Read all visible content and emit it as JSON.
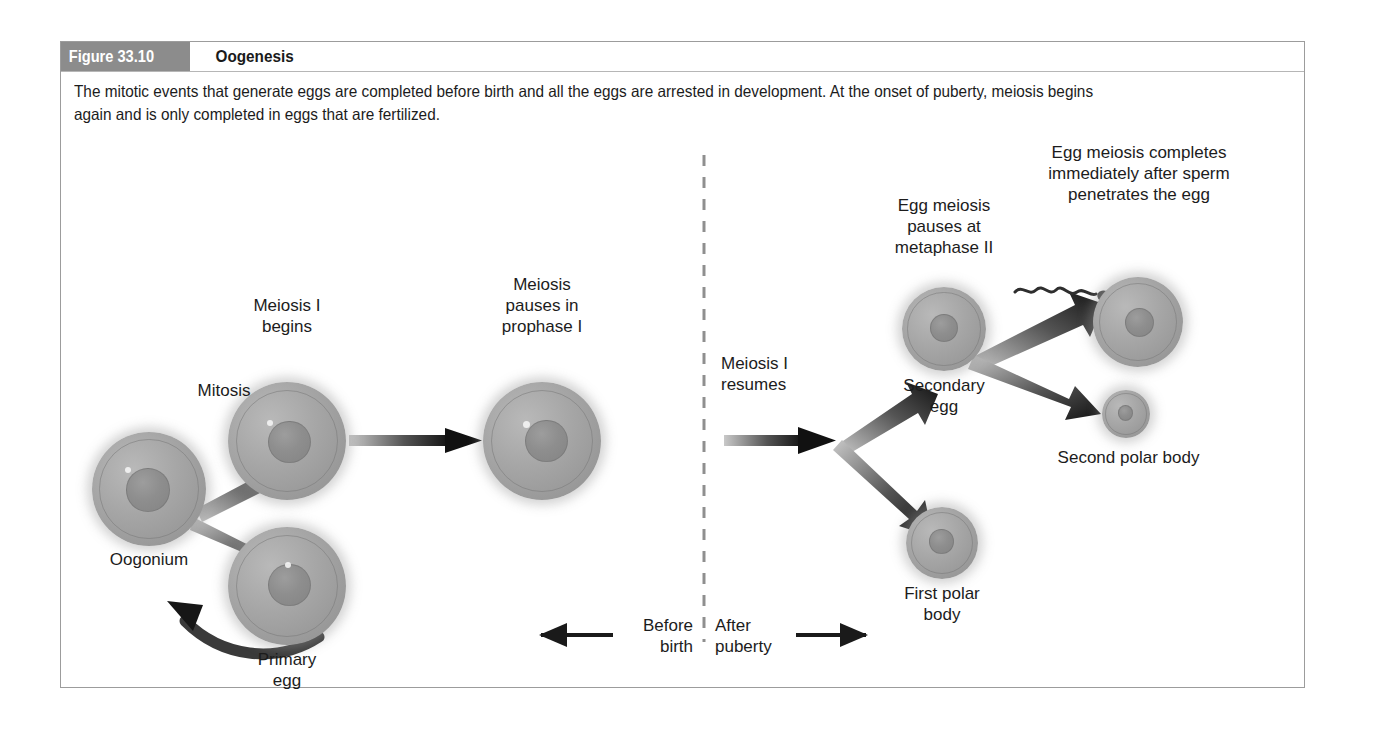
{
  "figure": {
    "number": "Figure 33.10",
    "title": "Oogenesis",
    "caption": "The mitotic events that generate eggs are completed before birth and all the eggs are arrested in development. At the onset of puberty, meiosis begins again and is only completed in eggs that are fertilized."
  },
  "colors": {
    "badge_bg": "#8c8c8c",
    "frame_border": "#9c9c9c",
    "cell_body": "#9a9a9a",
    "nucleus": "#8a8a8a",
    "arrow": "#1a1a1a",
    "divider": "#8f8f8f",
    "text": "#1c1c1c",
    "page_bg": "#ffffff"
  },
  "diagram": {
    "type": "process-flow",
    "divider_label_before": "Before\nbirth",
    "divider_label_after": "After\npuberty",
    "cells": [
      {
        "id": "oogonium",
        "label": "Oogonium",
        "label_pos": "below"
      },
      {
        "id": "meiosis-i-begins",
        "label": "Meiosis I\nbegins",
        "label_pos": "above"
      },
      {
        "id": "primary-egg",
        "label": "Primary\negg",
        "label_pos": "below"
      },
      {
        "id": "prophase-i",
        "label": "Meiosis\npauses in\nprophase I",
        "label_pos": "above"
      },
      {
        "id": "secondary-egg",
        "label": "Secondary\negg",
        "label_pos": "below"
      },
      {
        "id": "metaphase-ii",
        "label": "Egg meiosis\npauses at\nmetaphase II",
        "label_pos": "above"
      },
      {
        "id": "first-polar-body",
        "label": "First polar\nbody",
        "label_pos": "below"
      },
      {
        "id": "fertilized-egg",
        "label": "Egg meiosis completes\nimmediately after sperm\npenetrates the egg",
        "label_pos": "above"
      },
      {
        "id": "second-polar-body",
        "label": "Second polar body",
        "label_pos": "below"
      }
    ],
    "arrows": [
      {
        "id": "mitosis-up",
        "label": "Mitosis",
        "from": "oogonium",
        "to": "meiosis-i-begins"
      },
      {
        "id": "mitosis-down",
        "label": "",
        "from": "oogonium",
        "to": "primary-egg"
      },
      {
        "id": "primary-return",
        "label": "",
        "from": "primary-egg",
        "to": "oogonium"
      },
      {
        "id": "to-prophase",
        "label": "",
        "from": "meiosis-i-begins",
        "to": "prophase-i"
      },
      {
        "id": "meiosis-i-resumes",
        "label": "Meiosis I\nresumes",
        "from": "prophase-i",
        "to": "branch-point"
      },
      {
        "id": "to-secondary-egg",
        "label": "",
        "from": "branch-point",
        "to": "secondary-egg"
      },
      {
        "id": "to-first-polar",
        "label": "",
        "from": "branch-point",
        "to": "first-polar-body"
      },
      {
        "id": "to-fertilized",
        "label": "",
        "from": "secondary-egg",
        "to": "fertilized-egg"
      },
      {
        "id": "to-second-polar",
        "label": "",
        "from": "secondary-egg",
        "to": "second-polar-body"
      }
    ],
    "sperm": {
      "id": "sperm",
      "description": "sperm with flagellum penetrating fertilized egg"
    }
  }
}
